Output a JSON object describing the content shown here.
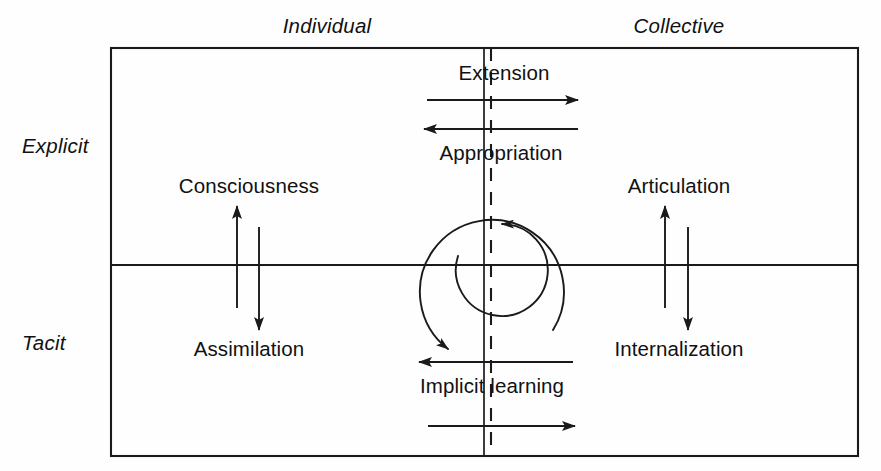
{
  "figure": {
    "kind": "two-by-two-knowledge-conversion-diagram",
    "axis_labels": {
      "top_left": "Individual",
      "top_right": "Collective",
      "left_top": "Explicit",
      "left_bottom": "Tacit"
    },
    "flows": [
      {
        "id": "extension",
        "label": "Extension",
        "direction": "right",
        "quadrant": "explicit"
      },
      {
        "id": "appropriation",
        "label": "Appropriation",
        "direction": "left",
        "quadrant": "explicit"
      },
      {
        "id": "consciousness",
        "label": "Consciousness",
        "direction": "up",
        "quadrant": "individual"
      },
      {
        "id": "assimilation",
        "label": "Assimilation",
        "direction": "down",
        "quadrant": "individual"
      },
      {
        "id": "articulation",
        "label": "Articulation",
        "direction": "up",
        "quadrant": "collective"
      },
      {
        "id": "internalization",
        "label": "Internalization",
        "direction": "down",
        "quadrant": "collective"
      },
      {
        "id": "implicit-learning",
        "label": "Implicit learning",
        "direction": "left",
        "quadrant": "tacit"
      },
      {
        "id": "tacit-diffusion",
        "label": "",
        "direction": "right",
        "quadrant": "tacit"
      }
    ],
    "spiral": {
      "description": "double spiral of knowledge conversion at the centre",
      "inner_arrow_direction": "left",
      "outer_arrow_direction": "down-right"
    },
    "colors": {
      "stroke": "#1a1a1a",
      "text": "#111111",
      "background": "#ffffff"
    }
  }
}
